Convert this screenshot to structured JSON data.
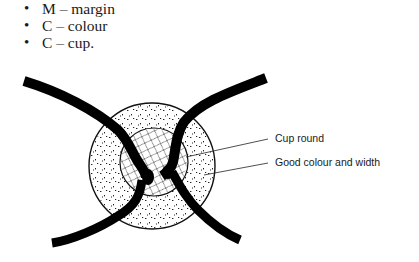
{
  "bullets": [
    {
      "letter": "M",
      "text": "M – margin"
    },
    {
      "letter": "C",
      "text": "C – colour"
    },
    {
      "letter": "C",
      "text": "C – cup."
    }
  ],
  "diagram": {
    "labels": {
      "cup": "Cup round",
      "rim": "Good colour and width"
    }
  }
}
